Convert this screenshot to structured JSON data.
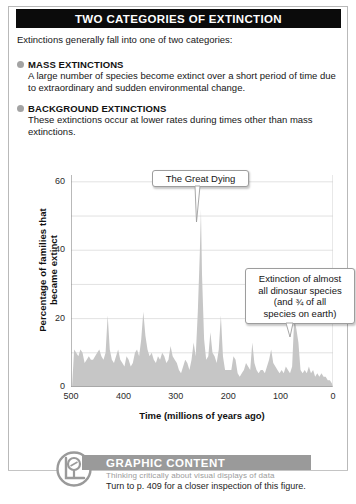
{
  "header": {
    "title": "TWO CATEGORIES OF EXTINCTION"
  },
  "intro": "Extinctions generally fall into one of two categories:",
  "categories": [
    {
      "bullet_icon": "bullet-dot-icon",
      "title": "MASS EXTINCTIONS",
      "body": "A large number of species become extinct over a short period of time due to extraordinary and sudden environmental change."
    },
    {
      "bullet_icon": "bullet-dot-icon",
      "title": "BACKGROUND EXTINCTIONS",
      "body": "These extinctions occur at lower rates during times other than mass extinctions."
    }
  ],
  "callouts": [
    {
      "id": "great-dying",
      "text": "The Great Dying"
    },
    {
      "id": "dinosaur",
      "lines": [
        "Extinction of almost",
        "all dinosaur species",
        "(and ¾ of all",
        "species on earth)"
      ]
    }
  ],
  "footer": {
    "logo_icon": "magnifier-chart-logo-icon",
    "title": "GRAPHIC CONTENT",
    "subtitle": "Thinking critically about visual displays of data",
    "note": "Turn to p. 409 for a closer inspection of this figure."
  },
  "colors": {
    "titlebar_bg": "#0b0b0b",
    "titlebar_text": "#ffffff",
    "bullet": "#a3a3a3",
    "area_fill": "#c6c6c6",
    "gridline": "#e2e2e2",
    "axis": "#8a8a8a",
    "banner_bg": "#9a9a9a",
    "panel_border": "#b9b9b9"
  },
  "chart_data": {
    "type": "area",
    "title": "",
    "xlabel": "Time  (millions of years ago)",
    "ylabel": "Percentage of families that became extinct",
    "xlim": [
      500,
      0
    ],
    "ylim": [
      0,
      62
    ],
    "x_reversed": true,
    "grid": true,
    "legend": "none",
    "xticks": [
      500,
      400,
      300,
      200,
      100,
      0
    ],
    "yticks": [
      0,
      20,
      40,
      60
    ],
    "y_minor_gridlines": [
      10,
      30,
      50
    ],
    "annotations": [
      {
        "label": "The Great Dying",
        "x": 252,
        "y": 52
      },
      {
        "label": "Extinction of almost all dinosaur species (and ¾ of all species on earth)",
        "x": 65,
        "y": 17
      }
    ],
    "x": [
      498,
      494,
      490,
      486,
      482,
      478,
      474,
      470,
      466,
      462,
      458,
      454,
      450,
      446,
      442,
      438,
      434,
      430,
      426,
      422,
      418,
      414,
      410,
      406,
      402,
      398,
      394,
      390,
      386,
      382,
      378,
      374,
      370,
      366,
      362,
      358,
      354,
      350,
      346,
      342,
      338,
      334,
      330,
      326,
      322,
      318,
      314,
      310,
      306,
      302,
      298,
      294,
      290,
      286,
      282,
      278,
      274,
      270,
      266,
      262,
      258,
      254,
      252,
      250,
      246,
      242,
      238,
      234,
      230,
      226,
      222,
      218,
      214,
      210,
      206,
      202,
      198,
      194,
      190,
      186,
      182,
      178,
      174,
      170,
      166,
      162,
      158,
      154,
      150,
      146,
      142,
      138,
      134,
      130,
      126,
      122,
      118,
      114,
      110,
      106,
      102,
      98,
      94,
      90,
      86,
      82,
      78,
      74,
      70,
      66,
      64,
      62,
      58,
      54,
      50,
      46,
      42,
      38,
      34,
      30,
      26,
      22,
      18,
      14,
      10,
      6,
      2,
      0
    ],
    "values": [
      0,
      11,
      10,
      9,
      11,
      10,
      7,
      8,
      9,
      8,
      8,
      9,
      10,
      11,
      9,
      8,
      10,
      21,
      11,
      8,
      7,
      9,
      11,
      8,
      7,
      6,
      9,
      8,
      6,
      7,
      10,
      11,
      9,
      14,
      22,
      15,
      11,
      9,
      10,
      8,
      7,
      9,
      8,
      10,
      9,
      7,
      8,
      12,
      9,
      8,
      7,
      5,
      4,
      6,
      8,
      7,
      5,
      8,
      13,
      9,
      22,
      40,
      52,
      33,
      14,
      8,
      9,
      16,
      10,
      9,
      7,
      11,
      21,
      9,
      5,
      5,
      5,
      5,
      9,
      8,
      4,
      3,
      4,
      5,
      7,
      6,
      5,
      13,
      7,
      5,
      4,
      5,
      5,
      4,
      6,
      8,
      11,
      7,
      6,
      5,
      4,
      5,
      4,
      6,
      5,
      4,
      6,
      20,
      17,
      13,
      9,
      5,
      4,
      5,
      4,
      6,
      4,
      5,
      3,
      4,
      3,
      4,
      3,
      3,
      2,
      2,
      1,
      0
    ]
  }
}
